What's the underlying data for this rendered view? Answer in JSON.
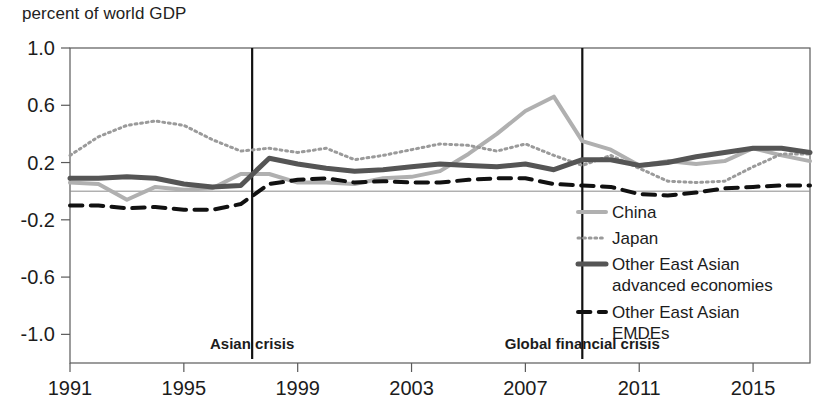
{
  "axis_title": "percent of world GDP",
  "chart_data": {
    "type": "line",
    "title": "",
    "xlabel": "",
    "ylabel": "percent of world GDP",
    "xlim": [
      1991,
      2017
    ],
    "ylim": [
      -1.2,
      1.0
    ],
    "yticks": [
      1.0,
      0.6,
      0.2,
      -0.2,
      -0.6,
      -1.0
    ],
    "ytick_labels": [
      "1.0",
      "0.6",
      "0.2",
      "-0.2",
      "-0.6",
      "-1.0"
    ],
    "xticks": [
      1991,
      1995,
      1999,
      2003,
      2007,
      2011,
      2015
    ],
    "xtick_labels": [
      "1991",
      "1995",
      "1999",
      "2003",
      "2007",
      "2011",
      "2015"
    ],
    "grid": false,
    "zero_line": true,
    "legend_position": "inside-right-lower",
    "x": [
      1991,
      1992,
      1993,
      1994,
      1995,
      1996,
      1997,
      1998,
      1999,
      2000,
      2001,
      2002,
      2003,
      2004,
      2005,
      2006,
      2007,
      2008,
      2009,
      2010,
      2011,
      2012,
      2013,
      2014,
      2015,
      2016,
      2017
    ],
    "series": [
      {
        "name": "China",
        "key": "china",
        "color": "#b0b0b0",
        "style": "solid",
        "width": 4,
        "values": [
          0.06,
          0.05,
          -0.06,
          0.03,
          0.01,
          0.02,
          0.12,
          0.12,
          0.06,
          0.06,
          0.05,
          0.09,
          0.1,
          0.14,
          0.26,
          0.4,
          0.56,
          0.66,
          0.35,
          0.29,
          0.18,
          0.21,
          0.19,
          0.21,
          0.3,
          0.25,
          0.21
        ]
      },
      {
        "name": "Japan",
        "key": "japan",
        "color": "#9a9a9a",
        "style": "dotted",
        "width": 3,
        "values": [
          0.25,
          0.38,
          0.46,
          0.49,
          0.46,
          0.36,
          0.28,
          0.3,
          0.27,
          0.3,
          0.22,
          0.25,
          0.29,
          0.33,
          0.32,
          0.28,
          0.33,
          0.25,
          0.18,
          0.25,
          0.16,
          0.07,
          0.06,
          0.07,
          0.17,
          0.26,
          0.26
        ]
      },
      {
        "name": "Other East Asian advanced economies",
        "key": "other_advanced",
        "color": "#555555",
        "style": "solid",
        "width": 5,
        "values": [
          0.09,
          0.09,
          0.1,
          0.09,
          0.05,
          0.03,
          0.04,
          0.23,
          0.19,
          0.16,
          0.14,
          0.15,
          0.17,
          0.19,
          0.18,
          0.17,
          0.19,
          0.15,
          0.22,
          0.22,
          0.18,
          0.2,
          0.24,
          0.27,
          0.3,
          0.3,
          0.27
        ]
      },
      {
        "name": "Other East Asian EMDEs",
        "key": "other_emdes",
        "color": "#111111",
        "style": "dashed",
        "width": 4,
        "values": [
          -0.1,
          -0.1,
          -0.12,
          -0.11,
          -0.13,
          -0.13,
          -0.09,
          0.05,
          0.08,
          0.09,
          0.06,
          0.07,
          0.06,
          0.06,
          0.08,
          0.09,
          0.09,
          0.05,
          0.04,
          0.03,
          -0.02,
          -0.03,
          -0.01,
          0.02,
          0.03,
          0.04,
          0.04
        ]
      }
    ],
    "annotations": [
      {
        "key": "asian_crisis",
        "label": "Asian crisis",
        "x": 1997.4
      },
      {
        "key": "gfc",
        "label": "Global financial crisis",
        "x": 2009.0
      }
    ]
  },
  "legend": {
    "items": [
      {
        "label": "China"
      },
      {
        "label": "Japan"
      },
      {
        "label": "Other East Asian"
      },
      {
        "label": "advanced economies"
      },
      {
        "label": "Other East Asian"
      },
      {
        "label": "EMDEs"
      }
    ]
  }
}
